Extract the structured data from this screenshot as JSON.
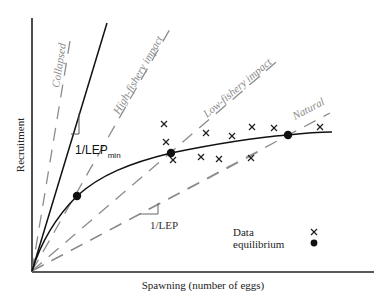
{
  "chart_data": {
    "type": "scatter",
    "title": "",
    "xlabel": "Spawning (number of eggs)",
    "ylabel": "Recruitment",
    "grid": false,
    "legend_position": "lower-right",
    "legend": [
      {
        "label": "Data",
        "marker": "x"
      },
      {
        "label": "equilibrium",
        "marker": "filled-circle"
      }
    ],
    "reference_lines": [
      {
        "label": "Collapsed",
        "style": "dashed",
        "color": "#8a8a8a",
        "from": [
          32,
          271
        ],
        "to": [
          70,
          41
        ]
      },
      {
        "label": "1/LEPmin",
        "style": "solid",
        "color": "#111111",
        "from": [
          32,
          271
        ],
        "to": [
          107,
          23
        ]
      },
      {
        "label": "High-fishery impact",
        "style": "dashed",
        "color": "#8a8a8a",
        "from": [
          32,
          271
        ],
        "to": [
          170,
          29
        ]
      },
      {
        "label": "Low-fishery impact",
        "style": "dashed",
        "color": "#8a8a8a",
        "from": [
          32,
          271
        ],
        "to": [
          281,
          58
        ]
      },
      {
        "label": "Natural",
        "style": "dashed",
        "color": "#8a8a8a",
        "from": [
          32,
          271
        ],
        "to": [
          330,
          113
        ]
      },
      {
        "label": "1/LEP",
        "style": "dashed",
        "color": "#8a8a8a",
        "from": [
          32,
          271
        ],
        "to": [
          262,
          150
        ]
      }
    ],
    "curve": {
      "label": "stock-recruitment",
      "points": [
        [
          32,
          271
        ],
        [
          45,
          240
        ],
        [
          60,
          215
        ],
        [
          77,
          196
        ],
        [
          100,
          178
        ],
        [
          130,
          164
        ],
        [
          171,
          153
        ],
        [
          220,
          144
        ],
        [
          288,
          135
        ],
        [
          332,
          132
        ]
      ]
    },
    "data_points": [
      [
        164,
        124
      ],
      [
        166,
        142
      ],
      [
        173,
        160
      ],
      [
        206,
        133
      ],
      [
        232,
        136
      ],
      [
        201,
        157
      ],
      [
        219,
        159
      ],
      [
        251,
        158
      ],
      [
        252,
        127
      ],
      [
        274,
        128
      ],
      [
        320,
        127
      ]
    ],
    "equilibria": [
      [
        77,
        196
      ],
      [
        171,
        153
      ],
      [
        288,
        135
      ]
    ]
  },
  "labels": {
    "collapsed": "Collapsed",
    "high_fishery": "High-fishery impact",
    "low_fishery": "Low-fishery impact",
    "natural": "Natural",
    "lep_min_main": "1/LEP",
    "lep_min_sub": "min",
    "lep": "1/LEP",
    "ylabel": "Recruitment",
    "xlabel": "Spawning (number of eggs)",
    "legend_data": "Data",
    "legend_equilibrium": "equilibrium"
  }
}
